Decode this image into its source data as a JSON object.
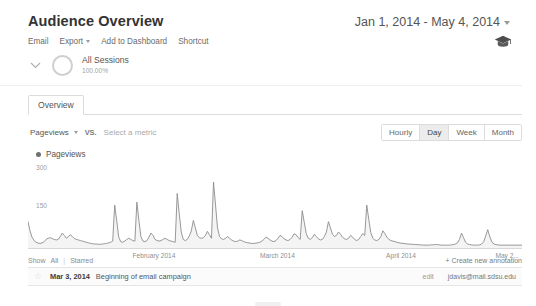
{
  "header": {
    "title": "Audience Overview",
    "date_range": "Jan 1, 2014 - May 4, 2014",
    "date_caret_icon": "chevron-down-icon"
  },
  "toolbar": {
    "email_label": "Email",
    "export_label": "Export",
    "export_caret_icon": "chevron-down-icon",
    "add_to_dashboard_label": "Add to Dashboard",
    "shortcut_label": "Shortcut",
    "help_icon": "graduation-cap-icon"
  },
  "segment": {
    "expand_icon": "chevron-down-icon",
    "donut_icon": "donut-chart-icon",
    "name": "All Sessions",
    "percent": "100.00%"
  },
  "tabs": [
    {
      "label": "Overview",
      "active": true
    }
  ],
  "metric_selector": {
    "primary_metric": "Pageviews",
    "primary_caret_icon": "chevron-down-icon",
    "vs_label": "VS.",
    "secondary_placeholder": "Select a metric"
  },
  "granularity": {
    "options": [
      "Hourly",
      "Day",
      "Week",
      "Month"
    ],
    "selected": "Day"
  },
  "chart_data": {
    "type": "line",
    "title": "Pageviews",
    "legend": [
      "Pageviews"
    ],
    "legend_position": "top-left",
    "xlabel": "",
    "ylabel": "",
    "ylim": [
      0,
      300
    ],
    "y_ticks": [
      "300",
      "150"
    ],
    "y_tick_values": [
      300,
      150
    ],
    "grid": false,
    "x_tick_labels": [
      "February 2014",
      "March 2014",
      "April 2014",
      "May 2..."
    ],
    "x_tick_positions_pct": [
      25.5,
      50.5,
      75.5,
      98.0
    ],
    "x_range": "Jan 1, 2014 - May 4, 2014",
    "series": [
      {
        "name": "Pageviews",
        "color": "#8c8c8c",
        "values": [
          92,
          60,
          38,
          26,
          20,
          17,
          16,
          18,
          22,
          30,
          34,
          36,
          33,
          30,
          28,
          30,
          40,
          52,
          44,
          34,
          40,
          46,
          40,
          33,
          30,
          28,
          26,
          24,
          22,
          20,
          18,
          16,
          15,
          14,
          14,
          13,
          13,
          14,
          15,
          16,
          18,
          20,
          24,
          150,
          95,
          38,
          22,
          20,
          24,
          30,
          34,
          30,
          26,
          24,
          160,
          96,
          40,
          24,
          22,
          26,
          38,
          52,
          44,
          30,
          26,
          24,
          26,
          30,
          34,
          30,
          26,
          24,
          22,
          20,
          190,
          120,
          56,
          30,
          26,
          30,
          42,
          60,
          96,
          70,
          44,
          36,
          34,
          36,
          44,
          58,
          46,
          34,
          230,
          150,
          70,
          40,
          32,
          30,
          34,
          40,
          34,
          28,
          24,
          22,
          24,
          28,
          26,
          22,
          20,
          18,
          17,
          16,
          16,
          17,
          18,
          20,
          24,
          30,
          38,
          34,
          28,
          24,
          22,
          26,
          34,
          44,
          40,
          32,
          28,
          26,
          30,
          38,
          50,
          46,
          36,
          30,
          130,
          90,
          50,
          34,
          30,
          36,
          48,
          40,
          32,
          28,
          30,
          40,
          56,
          92,
          70,
          48,
          40,
          44,
          56,
          48,
          38,
          32,
          30,
          34,
          44,
          38,
          30,
          26,
          30,
          40,
          50,
          44,
          150,
          100,
          54,
          34,
          28,
          26,
          30,
          40,
          60,
          50,
          38,
          30,
          26,
          24,
          22,
          20,
          18,
          17,
          16,
          15,
          14,
          14,
          13,
          13,
          12,
          12,
          11,
          11,
          10,
          10,
          10,
          10,
          11,
          11,
          12,
          12,
          11,
          10,
          10,
          10,
          10,
          10,
          11,
          12,
          14,
          18,
          30,
          52,
          36,
          20,
          14,
          12,
          11,
          10,
          10,
          10,
          11,
          14,
          22,
          42,
          64,
          40,
          22,
          14,
          12,
          11,
          10,
          10,
          10,
          10,
          10,
          10,
          10,
          10,
          10,
          10,
          10,
          10
        ]
      }
    ]
  },
  "annotations": {
    "show_label": "Show",
    "filter_all": "All",
    "filter_starred": "Starred",
    "create_label": "+ Create new annotation",
    "rows": [
      {
        "star_icon": "star-outline-icon",
        "date": "Mar 3, 2014",
        "text": "Beginning of email campaign",
        "edit_label": "edit",
        "author": "jdavis@mail.sdsu.edu"
      }
    ]
  }
}
